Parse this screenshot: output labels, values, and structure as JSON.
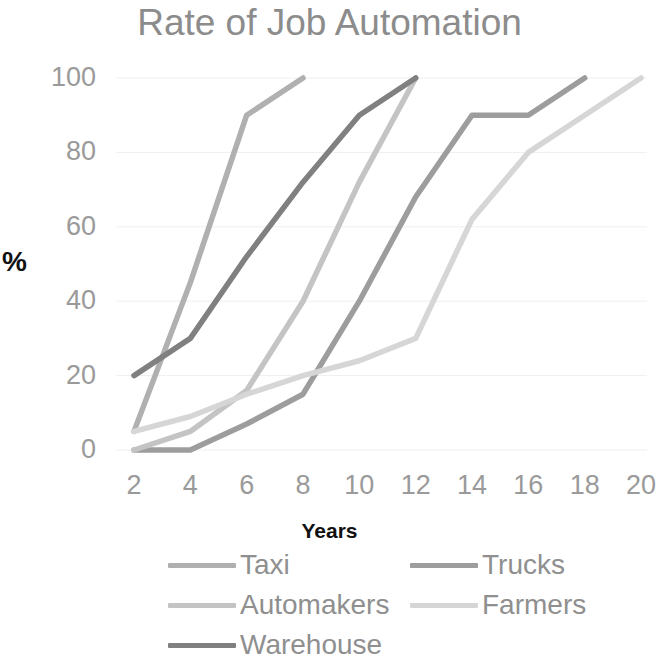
{
  "chart_data": {
    "type": "line",
    "title": "Rate of Job Automation",
    "xlabel": "Years",
    "ylabel": "%",
    "xlim": [
      2,
      20
    ],
    "ylim": [
      0,
      100
    ],
    "grid": true,
    "legend_position": "bottom",
    "x_ticks": [
      "2",
      "4",
      "6",
      "8",
      "10",
      "12",
      "14",
      "16",
      "18",
      "20"
    ],
    "y_ticks": [
      "0",
      "20",
      "40",
      "60",
      "80",
      "100"
    ],
    "x": [
      2,
      4,
      6,
      8,
      10,
      12,
      14,
      16,
      18,
      20
    ],
    "series": [
      {
        "name": "Taxi",
        "color": "#b0b0b0",
        "x": [
          2,
          4,
          6,
          8
        ],
        "values": [
          5,
          45,
          90,
          100
        ]
      },
      {
        "name": "Trucks",
        "color": "#9d9d9d",
        "x": [
          2,
          4,
          6,
          8,
          10,
          12,
          14,
          16,
          18
        ],
        "values": [
          0,
          0,
          7,
          15,
          40,
          68,
          90,
          90,
          100
        ]
      },
      {
        "name": "Automakers",
        "color": "#c4c4c4",
        "x": [
          2,
          4,
          6,
          8,
          10,
          12
        ],
        "values": [
          0,
          5,
          16,
          40,
          72,
          100
        ]
      },
      {
        "name": "Farmers",
        "color": "#d6d6d6",
        "x": [
          2,
          4,
          6,
          8,
          10,
          12,
          14,
          16,
          18,
          20
        ],
        "values": [
          5,
          9,
          15,
          20,
          24,
          30,
          62,
          80,
          90,
          100
        ]
      },
      {
        "name": "Warehouse",
        "color": "#808080",
        "x": [
          2,
          4,
          6,
          8,
          10,
          12
        ],
        "values": [
          20,
          30,
          52,
          72,
          90,
          100
        ]
      }
    ]
  },
  "legend": {
    "items": [
      {
        "label": "Taxi",
        "color": "#b0b0b0"
      },
      {
        "label": "Trucks",
        "color": "#9d9d9d"
      },
      {
        "label": "Automakers",
        "color": "#c4c4c4"
      },
      {
        "label": "Farmers",
        "color": "#d6d6d6"
      },
      {
        "label": "Warehouse",
        "color": "#808080"
      }
    ]
  },
  "style": {
    "title_color": "#8c8c8c",
    "tick_color": "#9a9a9a",
    "axis_title_color": "#101010",
    "gridline_color": "#efefef",
    "background": "#ffffff"
  }
}
